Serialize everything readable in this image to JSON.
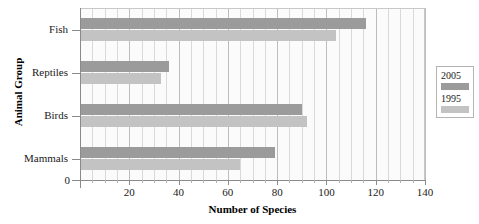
{
  "chart_data": {
    "type": "bar",
    "orientation": "horizontal",
    "title": "",
    "xlabel": "Number of Species",
    "ylabel": "Animal Group",
    "categories": [
      "Mammals",
      "Birds",
      "Reptiles",
      "Fish"
    ],
    "series": [
      {
        "name": "2005",
        "color": "#9b9b9b",
        "values": [
          79,
          90,
          36,
          116
        ]
      },
      {
        "name": "1995",
        "color": "#c3c3c3",
        "values": [
          65,
          92,
          33,
          104
        ]
      }
    ],
    "xlim": [
      0,
      140
    ],
    "ylim": [
      0,
      4
    ],
    "xticks": [
      0,
      20,
      40,
      60,
      80,
      100,
      120,
      140
    ],
    "xtick_labels": [
      "0",
      "20",
      "40",
      "60",
      "80",
      "100",
      "120",
      "140"
    ],
    "xminor_step": 5,
    "grid": "vertical",
    "legend_position": "right-outside",
    "origin_label": "0"
  },
  "legend": {
    "entries": [
      {
        "label": "2005",
        "color": "#9b9b9b"
      },
      {
        "label": "1995",
        "color": "#c3c3c3"
      }
    ]
  },
  "axes": {
    "x_title": "Number of Species",
    "y_title": "Animal Group"
  }
}
